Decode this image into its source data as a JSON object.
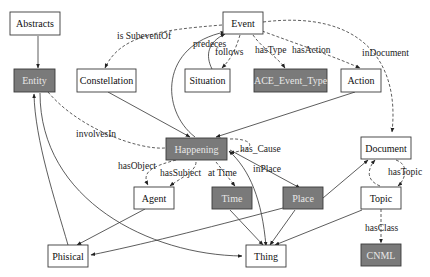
{
  "colors": {
    "shaded_fill": "#7a7a7a",
    "plain_fill": "#ffffff",
    "stroke": "#3a3a3a"
  },
  "nodes": {
    "abstracts": "Abstracts",
    "event": "Event",
    "entity": "Entity",
    "constellation": "Constellation",
    "situation": "Situation",
    "ace_event_type": "ACE_Event_Type",
    "action": "Action",
    "happening": "Happening",
    "document": "Document",
    "agent": "Agent",
    "time": "Time",
    "place": "Place",
    "topic": "Topic",
    "phisical": "Phisical",
    "thing": "Thing",
    "cnml": "CNML"
  },
  "edge_labels": {
    "is_subevent_of": "is SubeventOf",
    "predeces": "predeces",
    "follows": "follows",
    "has_type": "hasType",
    "has_action": "hasAction",
    "in_document": "inDocument",
    "involves_in": "involvesIn",
    "has_cause": "has_Cause",
    "in_place": "inPlace",
    "has_object": "hasObject",
    "has_subject": "hasSubject",
    "at_time": "at Time",
    "has_topic": "hasTopic",
    "has_class": "hasClass"
  }
}
